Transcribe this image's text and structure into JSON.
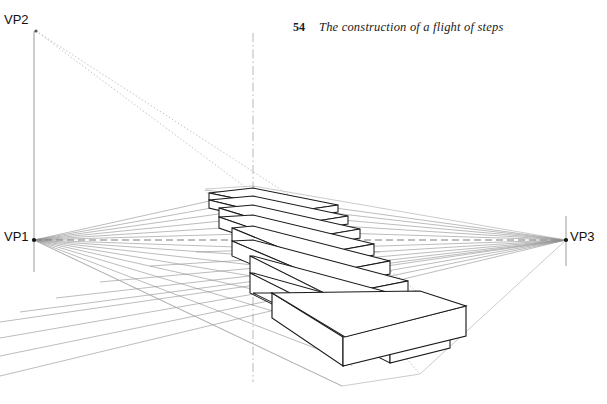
{
  "page": {
    "number": "54",
    "title": "The construction of a flight of steps"
  },
  "labels": {
    "vp1": "VP1",
    "vp2": "VP2",
    "vp3": "VP3"
  },
  "colors": {
    "background": "#ffffff",
    "ink": "#111111",
    "construction_line": "#8e8e8e",
    "light_construction_line": "#b4b4b4",
    "dotted_guide": "#a9a9a9",
    "axis_line": "#9a9a9a",
    "step_outline": "#1a1a1a"
  },
  "diagram": {
    "type": "perspective-construction-drawing",
    "vanishing_points": [
      {
        "name": "VP1",
        "x": 34,
        "y": 240
      },
      {
        "name": "VP2",
        "x": 36,
        "y": 31
      },
      {
        "name": "VP3",
        "x": 566,
        "y": 240
      }
    ],
    "horizon_line": {
      "y": 240,
      "x_start": 34,
      "x_end": 566,
      "style": "dashed"
    },
    "vertical_axis_left": {
      "x": 34,
      "y_top": 31,
      "y_bottom": 272
    },
    "vertical_axis_right": {
      "x": 566,
      "y_top": 216,
      "y_bottom": 266
    },
    "vertical_centre_line": {
      "x": 253,
      "y_top": 33,
      "y_bottom": 382,
      "style": "dash-dot"
    },
    "step_count": 10,
    "steps": [
      {
        "index": 1,
        "front_left_x": 350,
        "front_left_y": 362,
        "tread_y": 338,
        "riser_height": 24
      },
      {
        "index": 2,
        "front_left_x": 327,
        "front_left_y": 334,
        "tread_y": 313,
        "riser_height": 21
      },
      {
        "index": 3,
        "front_left_x": 306,
        "front_left_y": 308,
        "tread_y": 290,
        "riser_height": 18
      },
      {
        "index": 4,
        "front_left_x": 288,
        "front_left_y": 285,
        "tread_y": 269,
        "riser_height": 16
      },
      {
        "index": 5,
        "front_left_x": 272,
        "front_left_y": 264,
        "tread_y": 250,
        "riser_height": 14
      },
      {
        "index": 6,
        "front_left_x": 256,
        "front_left_y": 246,
        "tread_y": 234,
        "riser_height": 12
      },
      {
        "index": 7,
        "front_left_x": 242,
        "front_left_y": 230,
        "tread_y": 220,
        "riser_height": 10
      },
      {
        "index": 8,
        "front_left_x": 230,
        "front_left_y": 216,
        "tread_y": 208,
        "riser_height": 9
      },
      {
        "index": 9,
        "front_left_x": 219,
        "front_left_y": 204,
        "tread_y": 197,
        "riser_height": 8
      },
      {
        "index": 10,
        "front_left_x": 209,
        "front_left_y": 193,
        "tread_y": 187,
        "riser_height": 7
      }
    ],
    "vp2_rays": 2,
    "vp1_rays": 14,
    "vp3_rays": 14
  }
}
